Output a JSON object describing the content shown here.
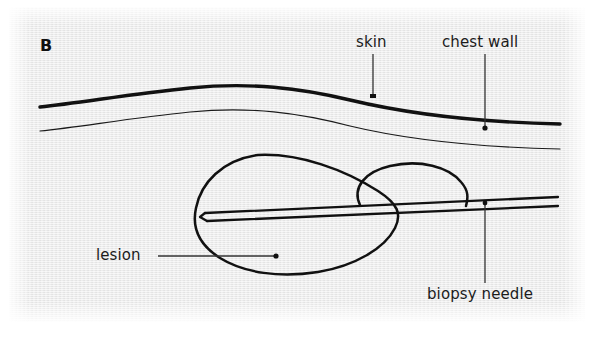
{
  "figure": {
    "panel_letter": "B",
    "background_color": "#e9e9e9",
    "ink_color": "#111111",
    "width": 594,
    "height": 340
  },
  "labels": {
    "skin": "skin",
    "chest_wall": "chest wall",
    "lesion": "lesion",
    "biopsy_needle": "biopsy needle"
  },
  "diagram": {
    "type": "medical-illustration",
    "elements": [
      {
        "name": "skin-line",
        "description": "thick wavy line representing the skin surface",
        "stroke_width": 3.2
      },
      {
        "name": "chest-wall-line",
        "description": "thin wavy line below the skin representing the chest wall",
        "stroke_width": 1.2
      },
      {
        "name": "lesion-outline",
        "description": "large irregular tilted blob outline representing the lesion",
        "stroke_width": 2.4
      },
      {
        "name": "lesion-secondary-lobe",
        "description": "smaller rounded lobe of the lesion to the right",
        "stroke_width": 2.4
      },
      {
        "name": "biopsy-needle",
        "description": "long two-line needle shaft entering from the right with a beveled tip inside the lesion",
        "stroke_width": 2.2
      }
    ],
    "leader_lines": [
      {
        "name": "skin-leader",
        "from_label": "skin",
        "style": "vertical line, no terminal dot"
      },
      {
        "name": "chest-wall-leader",
        "from_label": "chest wall",
        "style": "vertical line ending in dot"
      },
      {
        "name": "lesion-leader",
        "from_label": "lesion",
        "style": "horizontal line ending in dot"
      },
      {
        "name": "biopsy-needle-leader",
        "from_label": "biopsy needle",
        "style": "vertical line ending in dot"
      }
    ]
  }
}
